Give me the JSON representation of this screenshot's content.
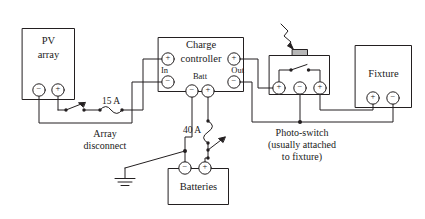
{
  "diagram": {
    "stroke_color": "#231f20",
    "background_color": "#ffffff",
    "components": {
      "pv_array": {
        "label_line1": "PV",
        "label_line2": "array",
        "terminals": [
          {
            "name": "negative",
            "symbol": "−"
          },
          {
            "name": "positive",
            "symbol": "+"
          }
        ]
      },
      "charge_controller": {
        "label_line1": "Charge",
        "label_line2": "controller",
        "group_in": "In",
        "group_out": "Out",
        "group_batt": "Batt",
        "terminals": [
          {
            "name": "in-positive",
            "symbol": "+"
          },
          {
            "name": "in-negative",
            "symbol": "−"
          },
          {
            "name": "out-positive",
            "symbol": "+"
          },
          {
            "name": "out-negative",
            "symbol": "−"
          },
          {
            "name": "batt-negative",
            "symbol": "−"
          },
          {
            "name": "batt-positive",
            "symbol": "+"
          }
        ]
      },
      "photo_switch": {
        "caption_line1": "Photo-switch",
        "caption_line2": "(usually attached",
        "caption_line3": "to fixture)",
        "terminals": [
          {
            "name": "left-positive",
            "symbol": "+"
          },
          {
            "name": "center-negative",
            "symbol": "−"
          },
          {
            "name": "right-positive",
            "symbol": "+"
          }
        ]
      },
      "fixture": {
        "label": "Fixture",
        "terminals": [
          {
            "name": "positive",
            "symbol": "+"
          },
          {
            "name": "negative",
            "symbol": "−"
          }
        ]
      },
      "batteries": {
        "label": "Batteries",
        "terminals": [
          {
            "name": "negative",
            "symbol": "−"
          },
          {
            "name": "positive",
            "symbol": "+"
          }
        ]
      }
    },
    "annotations": {
      "array_fuse_rating": "15 A",
      "array_disconnect_line1": "Array",
      "array_disconnect_line2": "disconnect",
      "battery_fuse_rating": "40 A"
    },
    "icons": {
      "ground": "ground-symbol",
      "light_ray": "light-ray-arrow",
      "sensor": "photo-sensor",
      "fuse_array": "fuse-symbol",
      "fuse_battery": "fuse-symbol",
      "switch_array": "knife-switch-symbol",
      "switch_battery": "knife-switch-symbol"
    }
  }
}
